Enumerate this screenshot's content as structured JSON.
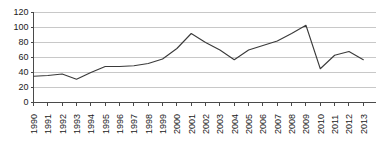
{
  "chart_data": {
    "type": "line",
    "title": "",
    "subtitle": "",
    "xlabel": "",
    "ylabel": "",
    "categories": [
      "1990",
      "1991",
      "1992",
      "1993",
      "1994",
      "1995",
      "1996",
      "1997",
      "1998",
      "1999",
      "2000",
      "2001",
      "2002",
      "2003",
      "2004",
      "2005",
      "2006",
      "2007",
      "2008",
      "2009",
      "2010",
      "2011",
      "2012",
      "2013"
    ],
    "values": [
      35,
      36,
      38,
      31,
      40,
      48,
      48,
      49,
      52,
      58,
      72,
      92,
      80,
      70,
      57,
      70,
      76,
      82,
      92,
      103,
      45,
      63,
      68,
      57
    ],
    "series": [
      {
        "name": "series-1",
        "values": [
          35,
          36,
          38,
          31,
          40,
          48,
          48,
          49,
          52,
          58,
          72,
          92,
          80,
          70,
          57,
          70,
          76,
          82,
          92,
          103,
          45,
          63,
          68,
          57
        ]
      }
    ],
    "ylim": [
      0,
      120
    ],
    "yticks": [
      0,
      20,
      40,
      60,
      80,
      100,
      120
    ],
    "ytick_labels": [
      "0",
      "20",
      "40",
      "60",
      "80",
      "100",
      "120"
    ],
    "grid": true,
    "grid_axis": "y",
    "legend": false,
    "legend_position": "none",
    "line_color": "#3a3a3a",
    "grid_color": "#c8c8c8",
    "axis_color": "#4a4a4a",
    "background_color": "#ffffff",
    "annotations": []
  }
}
